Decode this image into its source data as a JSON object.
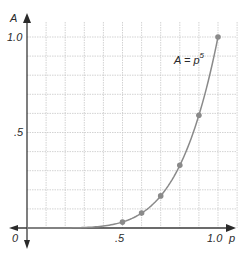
{
  "chart_data": {
    "type": "line",
    "title": "",
    "xlabel": "p",
    "ylabel": "A",
    "xlim": [
      0,
      1.0
    ],
    "ylim": [
      0,
      1.0
    ],
    "grid": true,
    "grid_step": 0.1,
    "x_ticks": [
      "0",
      ".5",
      "1.0"
    ],
    "y_ticks": [
      ".5",
      "1.0"
    ],
    "annotation": {
      "text": "A = p",
      "exponent": "5",
      "x": 0.78,
      "y": 0.89
    },
    "series": [
      {
        "name": "A = p^5",
        "curve": "A = p^5",
        "points": [
          {
            "x": 0.5,
            "y": 0.031
          },
          {
            "x": 0.6,
            "y": 0.078
          },
          {
            "x": 0.7,
            "y": 0.168
          },
          {
            "x": 0.8,
            "y": 0.328
          },
          {
            "x": 0.9,
            "y": 0.59
          },
          {
            "x": 1.0,
            "y": 1.0
          }
        ]
      }
    ],
    "colors": {
      "curve": "#8a8a8a",
      "points": "#8a8a8a",
      "axes": "#3a3a3a",
      "grid": "#c8c8c8"
    }
  }
}
